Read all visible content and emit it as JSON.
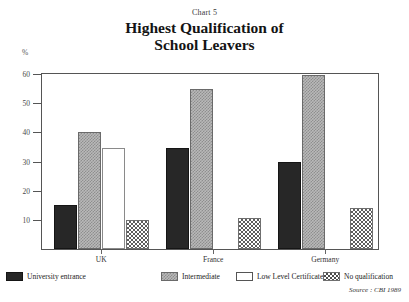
{
  "header": {
    "chart_number": "Chart 5",
    "title_line1": "Highest Qualification of",
    "title_line2": "School Leavers"
  },
  "axis": {
    "y_unit": "%"
  },
  "source_note": "Source : CBI 1989",
  "chart_data": {
    "type": "bar",
    "title": "Highest Qualification of School Leavers",
    "subtitle": "Chart 5",
    "xlabel": "",
    "ylabel": "%",
    "ylim": [
      0,
      60
    ],
    "yticks": [
      0,
      10,
      20,
      30,
      40,
      50,
      60
    ],
    "ytick_labels": [
      "0",
      "10",
      "20",
      "30",
      "40",
      "50",
      "60"
    ],
    "grid": false,
    "legend_position": "bottom",
    "categories": [
      "UK",
      "France",
      "Germany"
    ],
    "series": [
      {
        "name": "University entrance",
        "values": [
          15,
          34.5,
          30
        ],
        "color": "#272727",
        "pattern": "solid"
      },
      {
        "name": "Intermediate",
        "values": [
          40,
          55,
          59.5
        ],
        "color": "#b9b9b9",
        "pattern": "fine-dot"
      },
      {
        "name": "Low Level Certificate",
        "values": [
          34.5,
          0,
          0
        ],
        "color": "#ffffff",
        "pattern": "outline"
      },
      {
        "name": "No qualification",
        "values": [
          10,
          10.5,
          14
        ],
        "color": "#ffffff",
        "pattern": "checker"
      }
    ]
  }
}
